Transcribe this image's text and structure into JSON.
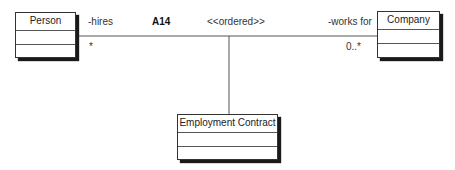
{
  "diagram": {
    "type": "UML class diagram (association class)",
    "classes": [
      {
        "id": "person",
        "name": "Person"
      },
      {
        "id": "company",
        "name": "Company"
      },
      {
        "id": "employment_contract",
        "name": "Employment Contract"
      }
    ],
    "association": {
      "name": "A14",
      "stereotype": "<<ordered>>",
      "ends": {
        "left": {
          "role": "-hires",
          "multiplicity": "*"
        },
        "right": {
          "role": "-works for",
          "multiplicity": "0..*"
        }
      },
      "association_class": "Employment Contract"
    },
    "colors": {
      "line": "#555555",
      "border": "#333333",
      "shadow": "#1a1a1a",
      "background": "#ffffff"
    }
  }
}
